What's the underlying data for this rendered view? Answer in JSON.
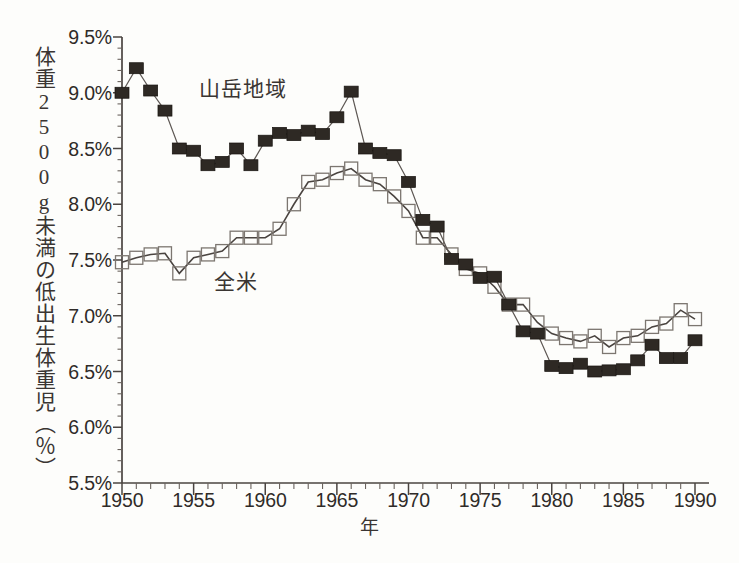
{
  "figure": {
    "background_color": "#fdfdfb",
    "ylabel": "体重2500g未満の低出生体重児（％）",
    "xlabel": "年"
  },
  "annotations": {
    "mountain": "山岳地域",
    "national": "全米"
  },
  "chart_data": {
    "type": "line",
    "title": "",
    "xlabel": "年",
    "ylabel": "体重2500g未満の低出生体重児（％）",
    "xlim": [
      1950,
      1990
    ],
    "ylim": [
      5.5,
      9.5
    ],
    "grid": false,
    "legend": "inline-annotation",
    "y_ticks": [
      "5.5%",
      "6.0%",
      "6.5%",
      "7.0%",
      "7.5%",
      "8.0%",
      "8.5%",
      "9.0%",
      "9.5%"
    ],
    "y_tick_values": [
      5.5,
      6.0,
      6.5,
      7.0,
      7.5,
      8.0,
      8.5,
      9.0,
      9.5
    ],
    "y_minor_tick_step": 0.1,
    "x_ticks": [
      "1950",
      "1955",
      "1960",
      "1965",
      "1970",
      "1975",
      "1980",
      "1985",
      "1990"
    ],
    "x_tick_values": [
      1950,
      1955,
      1960,
      1965,
      1970,
      1975,
      1980,
      1985,
      1990
    ],
    "x_minor_tick_step": 1,
    "x": [
      1950,
      1951,
      1952,
      1953,
      1954,
      1955,
      1956,
      1957,
      1958,
      1959,
      1960,
      1961,
      1962,
      1963,
      1964,
      1965,
      1966,
      1967,
      1968,
      1969,
      1970,
      1971,
      1972,
      1973,
      1974,
      1975,
      1976,
      1977,
      1978,
      1979,
      1980,
      1981,
      1982,
      1983,
      1984,
      1985,
      1986,
      1987,
      1988,
      1989,
      1990
    ],
    "series": [
      {
        "name": "山岳地域",
        "marker": "filled-square",
        "color": "#2e2924",
        "values": [
          9.0,
          9.22,
          9.02,
          8.84,
          8.5,
          8.48,
          8.35,
          8.38,
          8.5,
          8.35,
          8.57,
          8.64,
          8.62,
          8.66,
          8.63,
          8.78,
          9.01,
          8.5,
          8.46,
          8.44,
          8.2,
          7.86,
          7.8,
          7.51,
          7.46,
          7.34,
          7.35,
          7.1,
          6.86,
          6.84,
          6.55,
          6.53,
          6.57,
          6.5,
          6.51,
          6.52,
          6.6,
          6.74,
          6.62,
          6.62,
          6.78
        ]
      },
      {
        "name": "全米",
        "marker": "open-square",
        "color": "#7c7670",
        "values": [
          7.48,
          7.52,
          7.55,
          7.56,
          7.38,
          7.52,
          7.55,
          7.58,
          7.7,
          7.7,
          7.7,
          7.78,
          8.0,
          8.2,
          8.22,
          8.28,
          8.32,
          8.22,
          8.18,
          8.07,
          7.94,
          7.7,
          7.7,
          7.55,
          7.42,
          7.38,
          7.26,
          7.1,
          7.1,
          6.94,
          6.84,
          6.8,
          6.77,
          6.82,
          6.72,
          6.8,
          6.82,
          6.9,
          6.93,
          7.05,
          6.97
        ]
      }
    ]
  },
  "caption": ""
}
